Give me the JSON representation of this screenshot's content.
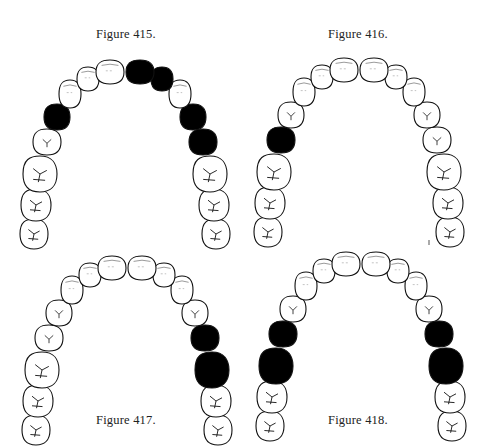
{
  "figures": [
    {
      "id": "415",
      "caption": "Figure 415.",
      "caption_position": "top",
      "filled_teeth": {
        "left": [
          "first_premolar"
        ],
        "right": [
          "central_incisor",
          "lateral_incisor",
          "first_premolar",
          "second_premolar"
        ]
      }
    },
    {
      "id": "416",
      "caption": "Figure 416.",
      "caption_position": "top",
      "filled_teeth": {
        "left": [
          "second_premolar"
        ],
        "right": []
      }
    },
    {
      "id": "417",
      "caption": "Figure 417.",
      "caption_position": "bottom",
      "filled_teeth": {
        "left": [],
        "right": [
          "second_premolar",
          "first_molar"
        ]
      }
    },
    {
      "id": "418",
      "caption": "Figure 418.",
      "caption_position": "bottom",
      "filled_teeth": {
        "left": [
          "second_premolar",
          "first_molar"
        ],
        "right": [
          "second_premolar",
          "first_molar"
        ]
      }
    }
  ],
  "colors": {
    "filled": "#000000",
    "outline": "#111111",
    "background": "#ffffff"
  }
}
